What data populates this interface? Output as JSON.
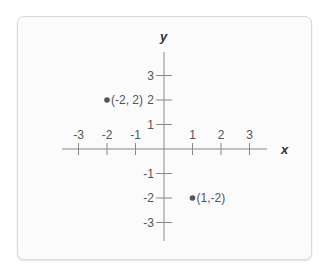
{
  "chart_data": {
    "type": "scatter",
    "title": "",
    "xlabel": "x",
    "ylabel": "y",
    "xlim": [
      -3.5,
      3.5
    ],
    "ylim": [
      -3.5,
      3.5
    ],
    "grid": false,
    "x_ticks": [
      -3,
      -2,
      -1,
      1,
      2,
      3
    ],
    "y_ticks": [
      3,
      2,
      1,
      -1,
      -2,
      -3
    ],
    "x_tick_labels": [
      "-3",
      "-2",
      "-1",
      "1",
      "2",
      "3"
    ],
    "y_tick_labels": [
      "3",
      "2",
      "1",
      "-1",
      "-2",
      "-3"
    ],
    "points": [
      {
        "x": -2,
        "y": 2,
        "label": "(-2, 2)"
      },
      {
        "x": 1,
        "y": -2,
        "label": "(1,-2)"
      }
    ]
  },
  "colors": {
    "axis": "#8a8a8a",
    "point": "#555555",
    "card_bg": "#fbfbfb",
    "card_border": "#d9d9d9"
  }
}
